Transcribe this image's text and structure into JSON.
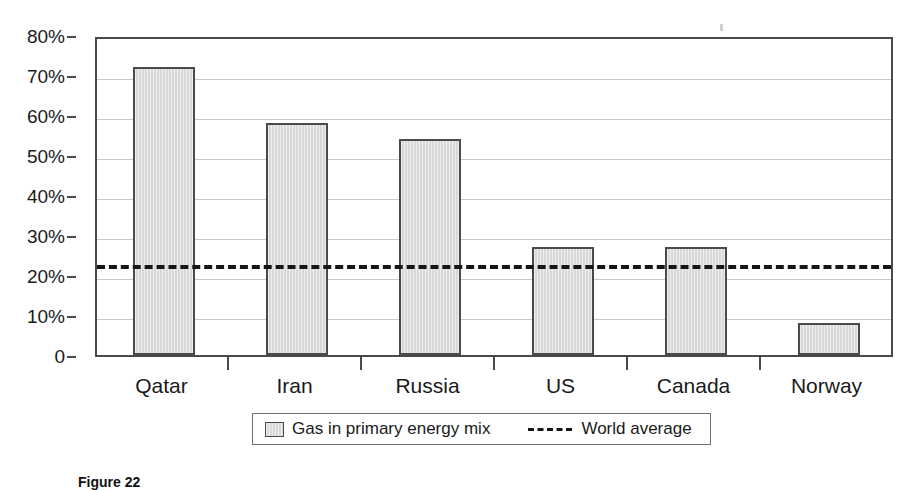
{
  "chart_data": {
    "type": "bar",
    "title": "",
    "subtitle": "",
    "xlabel": "",
    "ylabel": "",
    "categories": [
      "Qatar",
      "Iran",
      "Russia",
      "US",
      "Canada",
      "Norway"
    ],
    "series": [
      {
        "name": "Gas in primary energy mix",
        "type": "bar",
        "values": [
          72,
          58,
          54,
          27,
          27,
          8
        ],
        "unit": "%"
      },
      {
        "name": "World average",
        "type": "reference-line",
        "value": 23.5,
        "unit": "%"
      }
    ],
    "ylim": [
      0,
      80
    ],
    "ytick_values": [
      0,
      10,
      20,
      30,
      40,
      50,
      60,
      70,
      80
    ],
    "ytick_labels": [
      "0",
      "10%",
      "20%",
      "30%",
      "40%",
      "50%",
      "60%",
      "70%",
      "80%"
    ],
    "grid": true,
    "grid_axis": "y",
    "legend_position": "bottom",
    "legend": [
      {
        "label": "Gas in primary energy mix",
        "marker": "filled-square"
      },
      {
        "label": "World average",
        "marker": "dashed-line"
      }
    ],
    "colors": {
      "bar_fill": "#d9d9d9",
      "bar_edge": "#4a4a4a",
      "average_line": "#161616",
      "gridline": "#c9c9c9",
      "axis": "#4a4a4a",
      "text": "#1a1a1a",
      "background": "#ffffff"
    }
  },
  "caption": {
    "text": "Figure 22"
  }
}
